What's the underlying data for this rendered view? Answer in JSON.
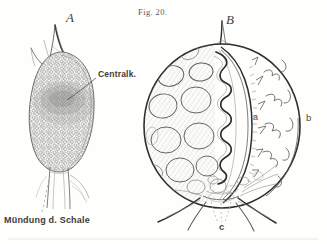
{
  "plate": {
    "figure_number": "Fig. 20.",
    "background_color": "#fefefc",
    "ink_color": "#5c5c59",
    "width": 327,
    "height": 244,
    "style": "engraving"
  },
  "labels": {
    "figure_a": "A",
    "figure_b": "B",
    "part_a": "a",
    "part_b": "b",
    "part_c": "c",
    "centralkapsel": "Centralk.",
    "muendung": "Mündung d. Schale"
  },
  "figures": [
    {
      "id": "A",
      "name": "figure-a-whole-organism",
      "description": "ovoid stippled cell body with apical spine and basal tube",
      "callouts": [
        "Centralk.",
        "Mündung d. Schale"
      ]
    },
    {
      "id": "B",
      "name": "figure-b-section",
      "description": "spherical shell in optical section with alveoli, inner capsule and basal spines",
      "callouts": [
        "a",
        "b",
        "c"
      ]
    }
  ]
}
